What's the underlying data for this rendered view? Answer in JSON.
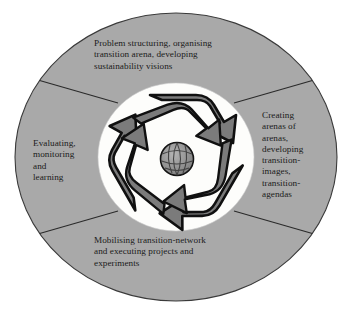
{
  "figure": {
    "center_icon": "recycling-globe-icon",
    "colors": {
      "page_background": "#ffffff",
      "outer_ring": "#a9a9a9",
      "inner_disc": "#fdfdfb",
      "arrow_fill": "#7b7b7b",
      "arrow_outline": "#101010",
      "divider_line": "#2a2a2a",
      "globe_fill": "#8d8d8d",
      "text": "#1b1b1b"
    },
    "segments": [
      {
        "id": "top",
        "position": "top",
        "label": "Problem structuring, organising\ntransition arena, developing\nsustainability visions"
      },
      {
        "id": "right",
        "position": "right",
        "label": "Creating\narenas of\narenas,\ndeveloping\ntransition-\nimages,\ntransition-\nagendas"
      },
      {
        "id": "bottom",
        "position": "bottom",
        "label": "Mobilising transition-network\nand executing projects and\nexperiments"
      },
      {
        "id": "left",
        "position": "left",
        "label": "Evaluating,\nmonitoring\nand\nlearning"
      }
    ]
  }
}
